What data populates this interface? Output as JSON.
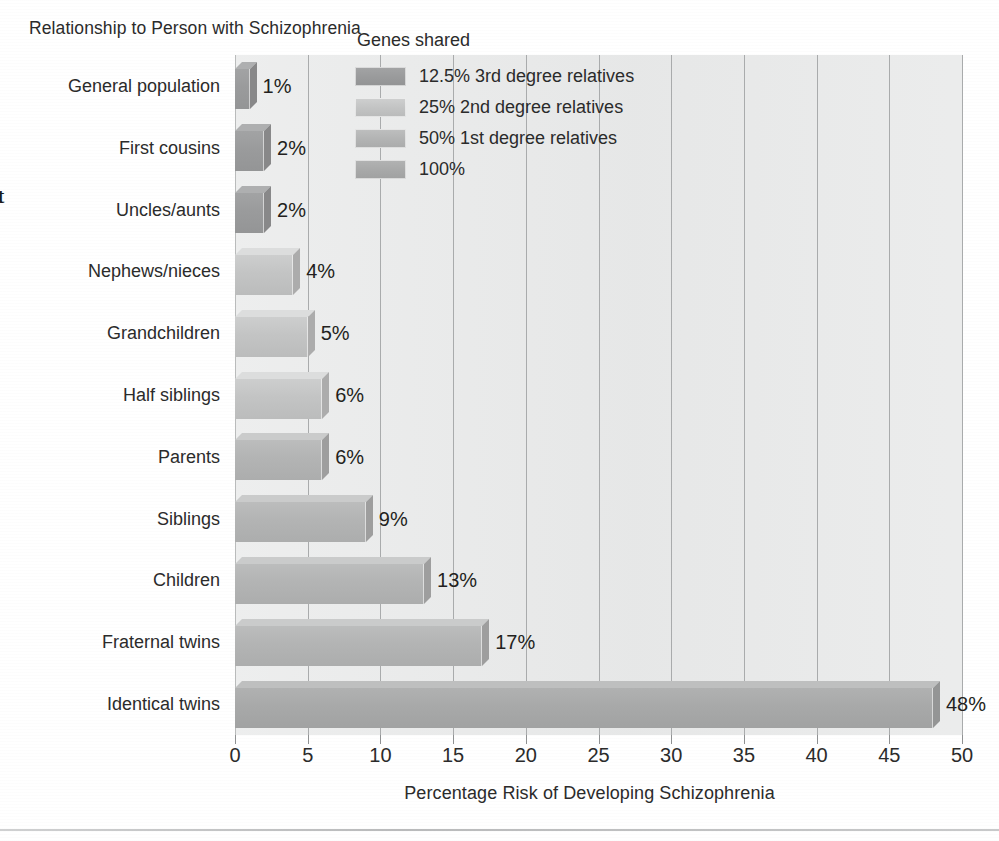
{
  "chart_data": {
    "type": "bar",
    "orientation": "horizontal",
    "title": "Relationship to Person with Schizophrenia",
    "xlabel": "Percentage Risk of Developing Schizophrenia",
    "ylabel": "",
    "xlim": [
      0,
      50
    ],
    "xticks": [
      0,
      5,
      10,
      15,
      20,
      25,
      30,
      35,
      40,
      45,
      50
    ],
    "xtick_labels": [
      "0",
      "5",
      "10",
      "15",
      "20",
      "25",
      "30",
      "35",
      "40",
      "45",
      "50"
    ],
    "grid": "vertical",
    "legend_position": "inside-top-right",
    "categories": [
      "General population",
      "First cousins",
      "Uncles/aunts",
      "Nephews/nieces",
      "Grandchildren",
      "Half siblings",
      "Parents",
      "Siblings",
      "Children",
      "Fraternal twins",
      "Identical twins"
    ],
    "values": [
      1,
      2,
      2,
      4,
      5,
      6,
      6,
      9,
      13,
      17,
      48
    ],
    "value_labels": [
      "1%",
      "2%",
      "2%",
      "4%",
      "5%",
      "6%",
      "6%",
      "9%",
      "13%",
      "17%",
      "48%"
    ],
    "series_group": [
      "12.5% 3rd degree relatives",
      "12.5% 3rd degree relatives",
      "12.5% 3rd degree relatives",
      "25% 2nd degree relatives",
      "25% 2nd degree relatives",
      "25% 2nd degree relatives",
      "50% 1st degree relatives",
      "50% 1st degree relatives",
      "50% 1st degree relatives",
      "50% 1st degree relatives",
      "100%"
    ],
    "legend": {
      "title": "Genes shared",
      "entries": [
        {
          "label": "12.5% 3rd degree relatives",
          "color": "#9a9b9c"
        },
        {
          "label": "25% 2nd degree relatives",
          "color": "#c3c4c4"
        },
        {
          "label": "50% 1st degree relatives",
          "color": "#b3b4b4"
        },
        {
          "label": "100%",
          "color": "#a8a9a9"
        }
      ]
    }
  },
  "colors": {
    "plot_background": "#e9eaea",
    "gridline": "#a9abac",
    "text": "#2b2b2b",
    "bar_3rd_degree": "#9a9b9c",
    "bar_2nd_degree": "#c3c4c4",
    "bar_1st_degree": "#b3b4b4",
    "bar_100": "#a8a9a9"
  },
  "page": {
    "edge_glyph": "t",
    "bleed_lines": [
      "the risk of developing schizophrenia",
      "increases as the number of shared",
      "genes increases between relatives",
      "of a person with the disorder",
      "concordance rates among twins",
      "suggest a strong genetic component",
      "yet environment also contributes",
      "to the expression of the illness"
    ]
  }
}
